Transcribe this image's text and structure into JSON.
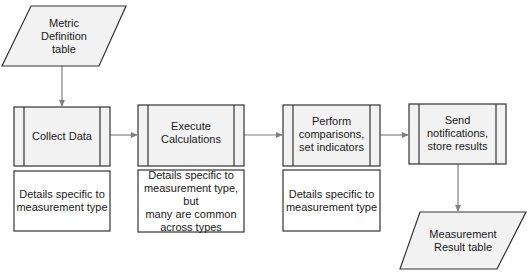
{
  "diagram": {
    "type": "flowchart",
    "colors": {
      "shape_fill": "#f2f2f2",
      "note_fill": "#ffffff",
      "stroke": "#333333",
      "connector": "#7f7f7f"
    },
    "inputs": [
      {
        "id": "metric-definition-table",
        "shape": "parallelogram",
        "label": "Metric\nDefinition\ntable"
      }
    ],
    "processes": [
      {
        "id": "collect-data",
        "shape": "predefined-process",
        "label": "Collect Data",
        "note": "Details specific to\nmeasurement type"
      },
      {
        "id": "execute-calculations",
        "shape": "predefined-process",
        "label": "Execute\nCalculations",
        "note": "Details specific to\nmeasurement type, but\nmany are common\nacross types"
      },
      {
        "id": "perform-comparisons",
        "shape": "predefined-process",
        "label": "Perform\ncomparisons,\nset indicators",
        "note": "Details specific to\nmeasurement type"
      },
      {
        "id": "send-notifications",
        "shape": "predefined-process",
        "label": "Send\nnotifications,\nstore results"
      }
    ],
    "outputs": [
      {
        "id": "measurement-result-table",
        "shape": "parallelogram",
        "label": "Measurement\nResult table"
      }
    ],
    "edges": [
      {
        "from": "metric-definition-table",
        "to": "collect-data"
      },
      {
        "from": "collect-data",
        "to": "execute-calculations"
      },
      {
        "from": "execute-calculations",
        "to": "perform-comparisons"
      },
      {
        "from": "perform-comparisons",
        "to": "send-notifications"
      },
      {
        "from": "send-notifications",
        "to": "measurement-result-table"
      }
    ]
  }
}
